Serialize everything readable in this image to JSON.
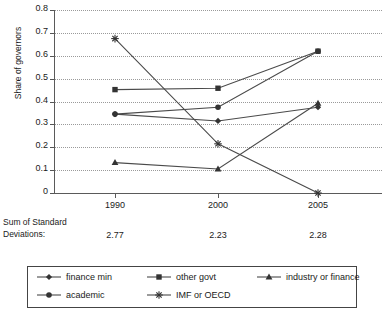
{
  "chart_data": {
    "type": "line",
    "title": "",
    "xlabel": "",
    "ylabel": "Share of governors",
    "categories": [
      "1990",
      "2000",
      "2005"
    ],
    "ylim": [
      0,
      0.8
    ],
    "yticks": [
      "0.8",
      "0.7",
      "0.6",
      "0.5",
      "0.4",
      "0.3",
      "0.2",
      "0.1",
      "0"
    ],
    "ytick_values": [
      0.8,
      0.7,
      0.6,
      0.5,
      0.4,
      0.3,
      0.2,
      0.1,
      0
    ],
    "grid": "horizontal-dotted",
    "legend_position": "bottom",
    "series": [
      {
        "name": "finance min",
        "marker": "diamond",
        "values": [
          0.345,
          0.315,
          0.375
        ]
      },
      {
        "name": "other govt",
        "marker": "square",
        "values": [
          0.452,
          0.458,
          0.62
        ]
      },
      {
        "name": "industry or finance",
        "marker": "triangle",
        "values": [
          0.133,
          0.105,
          0.392
        ]
      },
      {
        "name": "academic",
        "marker": "circle",
        "values": [
          0.345,
          0.375,
          0.62
        ]
      },
      {
        "name": "IMF or OECD",
        "marker": "asterisk",
        "values": [
          0.675,
          0.215,
          0.0
        ]
      }
    ],
    "annotations": {
      "sd_label_line1": "Sum of Standard",
      "sd_label_line2": "Deviations:",
      "sd_values": [
        "2.77",
        "2.23",
        "2.28"
      ]
    },
    "colors": {
      "line": "#4a4a4a",
      "marker": "#333333",
      "grid": "#9a9a9a",
      "axis": "#5a5a5a",
      "text": "#1a1a1a",
      "background": "#ffffff"
    }
  }
}
